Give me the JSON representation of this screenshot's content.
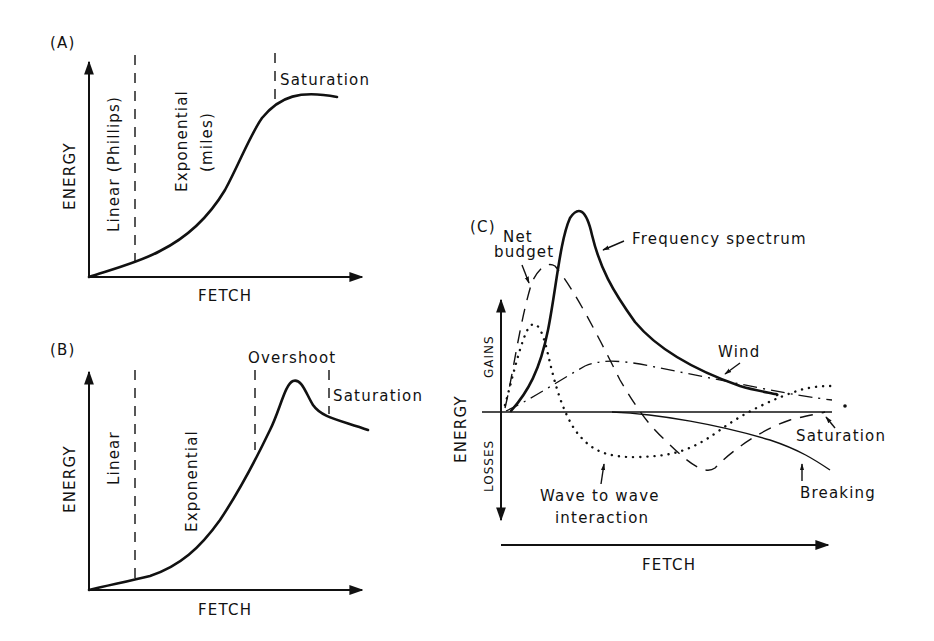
{
  "figure": {
    "panel_a": {
      "label": "(A)",
      "y_axis": "ENERGY",
      "x_axis": "FETCH",
      "regions": [
        "Linear (Phillips)",
        "Exponential (miles)",
        "Saturation"
      ],
      "region_line1": "Linear (Phillips)",
      "region_line2a": "Exponential",
      "region_line2b": "(miles)",
      "region_line3": "Saturation",
      "curve": "S-shaped growth: linear start, exponential rise, saturation plateau"
    },
    "panel_b": {
      "label": "(B)",
      "y_axis": "ENERGY",
      "x_axis": "FETCH",
      "region_line1": "Linear",
      "region_line2": "Exponential",
      "region_line3": "Overshoot",
      "region_line4": "Saturation",
      "curve": "Growth with overshoot peak then decline to saturation level"
    },
    "panel_c": {
      "label": "(C)",
      "y_axis": "ENERGY",
      "y_positive": "GAINS",
      "y_negative": "LOSSES",
      "x_axis": "FETCH",
      "net_budget_l1": "Net",
      "net_budget_l2": "budget",
      "frequency_spectrum": "Frequency spectrum",
      "wind": "Wind",
      "saturation": "Saturation",
      "breaking": "Breaking",
      "wave_l1": "Wave to wave",
      "wave_l2": "interaction",
      "series": [
        {
          "name": "Frequency spectrum",
          "style": "solid thick"
        },
        {
          "name": "Net budget",
          "style": "dashed"
        },
        {
          "name": "Wind",
          "style": "dash-dot"
        },
        {
          "name": "Wave to wave interaction",
          "style": "dotted"
        },
        {
          "name": "Breaking",
          "style": "solid thin"
        }
      ]
    }
  }
}
